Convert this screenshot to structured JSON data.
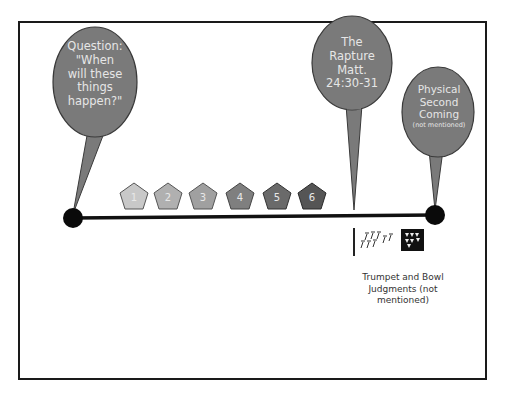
{
  "diagram": {
    "title": "",
    "bubbles": [
      {
        "id": "question",
        "lines": [
          "Question:",
          "\"When",
          "will these",
          "things",
          "happen?\""
        ]
      },
      {
        "id": "rapture",
        "lines": [
          "The",
          "Rapture",
          "Matt.",
          "24:30-31"
        ]
      },
      {
        "id": "second-coming",
        "lines": [
          "Physical",
          "Second",
          "Coming"
        ],
        "note": "(not mentioned)"
      }
    ],
    "seals": [
      {
        "label": "1",
        "color": "#c8c8c8"
      },
      {
        "label": "2",
        "color": "#b0b0b0"
      },
      {
        "label": "3",
        "color": "#a0a0a0"
      },
      {
        "label": "4",
        "color": "#7f7f7f"
      },
      {
        "label": "5",
        "color": "#6a6a6a"
      },
      {
        "label": "6",
        "color": "#555555"
      }
    ],
    "judgments_caption": "Trumpet and Bowl Judgments (not mentioned)",
    "colors": {
      "bubble_fill": "#7a7a7a",
      "bubble_stroke": "#3a3a3a",
      "timeline": "#111111",
      "frame": "#1a1a1a"
    }
  }
}
